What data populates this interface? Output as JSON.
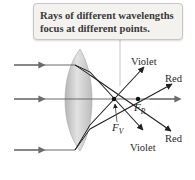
{
  "callout": {
    "text": "Rays of different wavelengths focus at different points."
  },
  "labels": {
    "violet_top": "Violet",
    "red_top": "Red",
    "red_bottom": "Red",
    "violet_bottom": "Violet",
    "focal_red": "F",
    "focal_red_sub": "R",
    "focal_violet": "F",
    "focal_violet_sub": "V"
  },
  "colors": {
    "lens_fill": "#c9c9c9",
    "ray": "#222222",
    "incoming_ray": "#6b6b6b",
    "callout_bg": "#f3f2ef"
  }
}
